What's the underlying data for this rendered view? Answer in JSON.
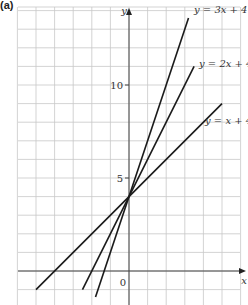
{
  "figure_label": "(a)",
  "chart_data": {
    "type": "line",
    "title": "",
    "xlabel": "x",
    "ylabel": "y",
    "xlim": [
      -6,
      6
    ],
    "ylim": [
      -1.8,
      14
    ],
    "grid": true,
    "y_ticks": [
      {
        "value": 5,
        "label": "5"
      },
      {
        "value": 10,
        "label": "10"
      }
    ],
    "origin_label": "0",
    "series": [
      {
        "name": "y = 3x + 4",
        "slope": 3,
        "intercept": 4,
        "x_range": [
          -1.8,
          3.2
        ],
        "points": [
          [
            -1.8,
            -1.4
          ],
          [
            3.2,
            13.6
          ]
        ]
      },
      {
        "name": "y = 2x + 4",
        "slope": 2,
        "intercept": 4,
        "x_range": [
          -2.5,
          3.5
        ],
        "points": [
          [
            -2.5,
            -1
          ],
          [
            3.5,
            11
          ]
        ]
      },
      {
        "name": "y = x + 4",
        "slope": 1,
        "intercept": 4,
        "x_range": [
          -5,
          5
        ],
        "points": [
          [
            -5,
            -1
          ],
          [
            5,
            9
          ]
        ]
      }
    ],
    "legend": "inline labels at line ends"
  }
}
